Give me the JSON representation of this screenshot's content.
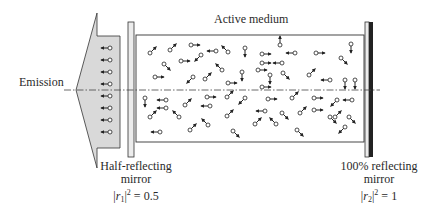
{
  "labels": {
    "active_medium": "Active medium",
    "emission": "Emission",
    "left_mirror": {
      "line1": "Half-reflecting",
      "line2": "mirror",
      "eq_lhs_var": "r",
      "eq_lhs_sub": "1",
      "eq_sup": "2",
      "eq_rhs": "0.5"
    },
    "right_mirror": {
      "line1": "100% reflecting",
      "line2": "mirror",
      "eq_lhs_var": "r",
      "eq_lhs_sub": "2",
      "eq_sup": "2",
      "eq_rhs": "1"
    }
  },
  "colors": {
    "stroke": "#333333",
    "emission_fill": "#d9d9d9",
    "mirror_fill": "#ececec",
    "mirror_dark": "#222222",
    "axis": "#444444"
  },
  "geometry": {
    "axis_y": 90,
    "box": {
      "x": 136,
      "y": 35,
      "w": 228,
      "h": 107
    },
    "left_mirror": {
      "x": 128,
      "y": 22,
      "w": 6,
      "h": 135
    },
    "right_mirror": {
      "x": 365,
      "y": 22,
      "w": 8,
      "h": 135
    },
    "emission_polygon": "97,13 76,90 97,168 97,148 120,148 120,36 97,36"
  },
  "emitted_photons": [
    {
      "x": 110,
      "y": 48
    },
    {
      "x": 110,
      "y": 60
    },
    {
      "x": 110,
      "y": 72
    },
    {
      "x": 110,
      "y": 84
    },
    {
      "x": 110,
      "y": 96
    },
    {
      "x": 110,
      "y": 108
    },
    {
      "x": 110,
      "y": 120
    },
    {
      "x": 110,
      "y": 132
    }
  ],
  "particles": [
    {
      "x": 150,
      "y": 53,
      "dir": "ne"
    },
    {
      "x": 170,
      "y": 50,
      "dir": "ne"
    },
    {
      "x": 191,
      "y": 45,
      "dir": "e"
    },
    {
      "x": 201,
      "y": 55,
      "dir": "sw"
    },
    {
      "x": 216,
      "y": 51,
      "dir": "w"
    },
    {
      "x": 181,
      "y": 61,
      "dir": "e"
    },
    {
      "x": 164,
      "y": 64,
      "dir": "se"
    },
    {
      "x": 155,
      "y": 77,
      "dir": "e"
    },
    {
      "x": 193,
      "y": 77,
      "dir": "sw"
    },
    {
      "x": 205,
      "y": 79,
      "dir": "ne"
    },
    {
      "x": 222,
      "y": 70,
      "dir": "nw"
    },
    {
      "x": 228,
      "y": 52,
      "dir": "nw"
    },
    {
      "x": 245,
      "y": 48,
      "dir": "s"
    },
    {
      "x": 262,
      "y": 54,
      "dir": "e"
    },
    {
      "x": 262,
      "y": 63,
      "dir": "e"
    },
    {
      "x": 280,
      "y": 45,
      "dir": "n"
    },
    {
      "x": 295,
      "y": 53,
      "dir": "w"
    },
    {
      "x": 282,
      "y": 63,
      "dir": "w"
    },
    {
      "x": 316,
      "y": 53,
      "dir": "e"
    },
    {
      "x": 351,
      "y": 44,
      "dir": "s"
    },
    {
      "x": 341,
      "y": 58,
      "dir": "se"
    },
    {
      "x": 258,
      "y": 70,
      "dir": "e"
    },
    {
      "x": 270,
      "y": 75,
      "dir": "s"
    },
    {
      "x": 283,
      "y": 73,
      "dir": "se"
    },
    {
      "x": 228,
      "y": 83,
      "dir": "e"
    },
    {
      "x": 309,
      "y": 75,
      "dir": "ne"
    },
    {
      "x": 330,
      "y": 80,
      "dir": "w"
    },
    {
      "x": 345,
      "y": 80,
      "dir": "s"
    },
    {
      "x": 355,
      "y": 80,
      "dir": "s"
    },
    {
      "x": 242,
      "y": 72,
      "dir": "s"
    },
    {
      "x": 145,
      "y": 98,
      "dir": "s"
    },
    {
      "x": 166,
      "y": 100,
      "dir": "w"
    },
    {
      "x": 166,
      "y": 108,
      "dir": "w"
    },
    {
      "x": 185,
      "y": 105,
      "dir": "ne"
    },
    {
      "x": 207,
      "y": 97,
      "dir": "e"
    },
    {
      "x": 210,
      "y": 106,
      "dir": "w"
    },
    {
      "x": 150,
      "y": 117,
      "dir": "ne"
    },
    {
      "x": 179,
      "y": 117,
      "dir": "nw"
    },
    {
      "x": 190,
      "y": 130,
      "dir": "ne"
    },
    {
      "x": 160,
      "y": 132,
      "dir": "w"
    },
    {
      "x": 208,
      "y": 125,
      "dir": "nw"
    },
    {
      "x": 227,
      "y": 97,
      "dir": "ne"
    },
    {
      "x": 245,
      "y": 98,
      "dir": "sw"
    },
    {
      "x": 268,
      "y": 99,
      "dir": "e"
    },
    {
      "x": 292,
      "y": 98,
      "dir": "ne"
    },
    {
      "x": 314,
      "y": 98,
      "dir": "e"
    },
    {
      "x": 337,
      "y": 100,
      "dir": "sw"
    },
    {
      "x": 352,
      "y": 100,
      "dir": "w"
    },
    {
      "x": 227,
      "y": 116,
      "dir": "ne"
    },
    {
      "x": 265,
      "y": 111,
      "dir": "w"
    },
    {
      "x": 282,
      "y": 113,
      "dir": "se"
    },
    {
      "x": 314,
      "y": 110,
      "dir": "e"
    },
    {
      "x": 300,
      "y": 113,
      "dir": "ne"
    },
    {
      "x": 255,
      "y": 124,
      "dir": "ne"
    },
    {
      "x": 276,
      "y": 124,
      "dir": "nw"
    },
    {
      "x": 297,
      "y": 130,
      "dir": "se"
    },
    {
      "x": 233,
      "y": 131,
      "dir": "se"
    },
    {
      "x": 335,
      "y": 117,
      "dir": "ne"
    },
    {
      "x": 330,
      "y": 117,
      "dir": "se"
    },
    {
      "x": 349,
      "y": 117,
      "dir": "se"
    },
    {
      "x": 345,
      "y": 127,
      "dir": "sw"
    },
    {
      "x": 262,
      "y": 87,
      "dir": "e"
    }
  ]
}
